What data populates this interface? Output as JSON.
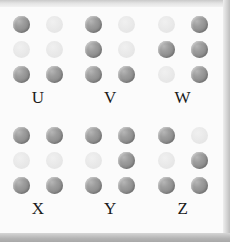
{
  "chart_data": {
    "type": "table",
    "grid_columns": 3,
    "grid_rows": 2,
    "cell_dot_columns": 2,
    "cell_dot_rows": 3,
    "dot_numbering": "Dot 1 = top-left, 2 = middle-left, 3 = bottom-left, 4 = top-right, 5 = middle-right, 6 = bottom-right",
    "categories": [
      "U",
      "V",
      "W",
      "X",
      "Y",
      "Z"
    ],
    "series": [
      {
        "name": "raised_dot_numbers",
        "values": [
          [
            1,
            3,
            6
          ],
          [
            1,
            2,
            3,
            6
          ],
          [
            2,
            4,
            5,
            6
          ],
          [
            1,
            3,
            4,
            6
          ],
          [
            1,
            3,
            4,
            5,
            6
          ],
          [
            1,
            3,
            5,
            6
          ]
        ]
      }
    ],
    "colors": {
      "raised_dot": "#8e8e8e",
      "raised_dot_highlight": "#b6b6b6",
      "flat_dot": "#e8e8e8",
      "letter_text": "#1b1b1b",
      "background": "#fbfbfb",
      "edge_bar": "#b4b4b4"
    }
  },
  "cells": [
    {
      "letter": "U",
      "dots": [
        {
          "position": 1,
          "raised": true
        },
        {
          "position": 4,
          "raised": false
        },
        {
          "position": 2,
          "raised": false
        },
        {
          "position": 5,
          "raised": false
        },
        {
          "position": 3,
          "raised": true
        },
        {
          "position": 6,
          "raised": true
        }
      ]
    },
    {
      "letter": "V",
      "dots": [
        {
          "position": 1,
          "raised": true
        },
        {
          "position": 4,
          "raised": false
        },
        {
          "position": 2,
          "raised": true
        },
        {
          "position": 5,
          "raised": false
        },
        {
          "position": 3,
          "raised": true
        },
        {
          "position": 6,
          "raised": true
        }
      ]
    },
    {
      "letter": "W",
      "dots": [
        {
          "position": 1,
          "raised": false
        },
        {
          "position": 4,
          "raised": true
        },
        {
          "position": 2,
          "raised": true
        },
        {
          "position": 5,
          "raised": true
        },
        {
          "position": 3,
          "raised": false
        },
        {
          "position": 6,
          "raised": true
        }
      ]
    },
    {
      "letter": "X",
      "dots": [
        {
          "position": 1,
          "raised": true
        },
        {
          "position": 4,
          "raised": true
        },
        {
          "position": 2,
          "raised": false
        },
        {
          "position": 5,
          "raised": false
        },
        {
          "position": 3,
          "raised": true
        },
        {
          "position": 6,
          "raised": true
        }
      ]
    },
    {
      "letter": "Y",
      "dots": [
        {
          "position": 1,
          "raised": true
        },
        {
          "position": 4,
          "raised": true
        },
        {
          "position": 2,
          "raised": false
        },
        {
          "position": 5,
          "raised": true
        },
        {
          "position": 3,
          "raised": true
        },
        {
          "position": 6,
          "raised": true
        }
      ]
    },
    {
      "letter": "Z",
      "dots": [
        {
          "position": 1,
          "raised": true
        },
        {
          "position": 4,
          "raised": false
        },
        {
          "position": 2,
          "raised": false
        },
        {
          "position": 5,
          "raised": true
        },
        {
          "position": 3,
          "raised": true
        },
        {
          "position": 6,
          "raised": true
        }
      ]
    }
  ]
}
